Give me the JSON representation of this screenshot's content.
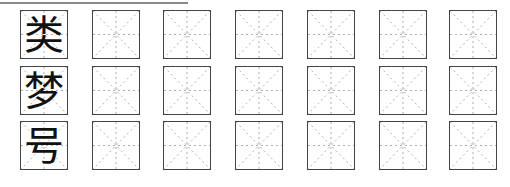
{
  "worksheet": {
    "rows": [
      {
        "character": "类",
        "practice_cells": 6
      },
      {
        "character": "梦",
        "practice_cells": 6
      },
      {
        "character": "号",
        "practice_cells": 6
      }
    ]
  },
  "style": {
    "border_color": "#444444",
    "guide_color": "#9a9a9a",
    "ink_color": "#111111"
  }
}
